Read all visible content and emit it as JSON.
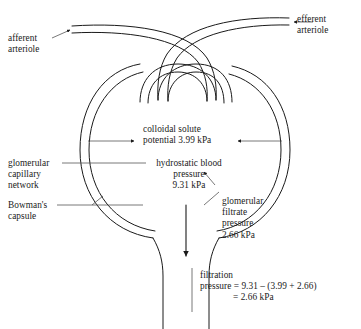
{
  "diagram": {
    "labels": {
      "afferent_arteriole": "afferent\narteriole",
      "efferent_arteriole": "efferent\narteriole",
      "glomerular_capillary_network": "glomerular\ncapillary\nnetwork",
      "bowmans_capsule": "Bowman's\ncapsule",
      "colloidal_solute_potential": "colloidal solute\npotential 3.99 kPa",
      "hydrostatic_blood_pressure": "hydrostatic blood\npressure\n9.31 kPa",
      "glomerular_filtrate_pressure": "glomerular\nfiltrate\npressure\n2.66 kPa"
    },
    "equation": {
      "line1": "filtration",
      "line2": "pressure = 9.31 – (3.99 + 2.66)",
      "line3": "= 2.66 kPa"
    },
    "values": {
      "colloidal_solute_potential_kpa": 3.99,
      "hydrostatic_blood_pressure_kpa": 9.31,
      "glomerular_filtrate_pressure_kpa": 2.66,
      "net_filtration_pressure_kpa": 2.66
    },
    "colors": {
      "stroke": "#1a1a1a",
      "background": "#ffffff",
      "leader": "#555555"
    }
  }
}
